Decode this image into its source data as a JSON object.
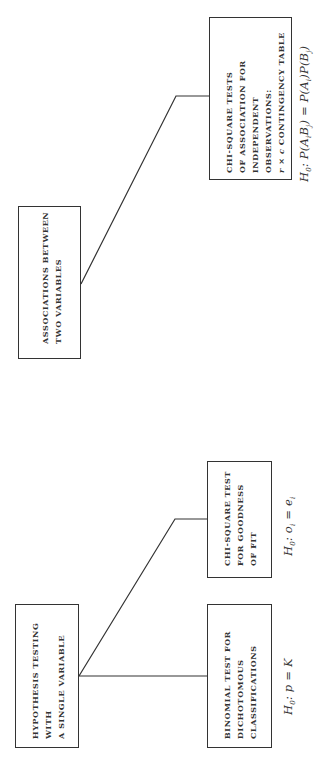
{
  "page": {
    "number": "248",
    "orientation": "rotated 90° counter-clockwise (read bottom to top)"
  },
  "diagram": {
    "groups": [
      {
        "parent": {
          "id": "single-variable",
          "lines": [
            "HYPOTHESIS TESTING",
            "WITH",
            "A SINGLE VARIABLE"
          ]
        },
        "children": [
          {
            "id": "binomial",
            "lines": [
              "BINOMIAL TEST FOR",
              "DICHOTOMOUS",
              "CLASSIFICATIONS"
            ],
            "hypothesis": {
              "prefix": "H",
              "sub": "0",
              "rest": ": p = K"
            }
          },
          {
            "id": "chi-square-gof",
            "lines": [
              "CHI-SQUARE TEST",
              "FOR GOODNESS",
              "OF FIT"
            ],
            "hypothesis": {
              "prefix": "H",
              "sub": "0",
              "rest": ": o",
              "sub2": "i",
              "rest2": " = e",
              "sub3": "i"
            }
          }
        ]
      },
      {
        "parent": {
          "id": "two-variables",
          "lines": [
            "ASSOCIATIONS BETWEEN",
            "TWO VARIABLES"
          ]
        },
        "children": [
          {
            "id": "chi-square-association",
            "lines": [
              "CHI-SQUARE TESTS",
              "OF ASSOCIATION FOR",
              "INDEPENDENT",
              "OBSERVATIONS:",
              "r × c CONTINGENCY TABLE"
            ],
            "hypothesis_text": "H0: P(AiBj) = P(Ai)P(Bj)"
          }
        ]
      }
    ]
  }
}
